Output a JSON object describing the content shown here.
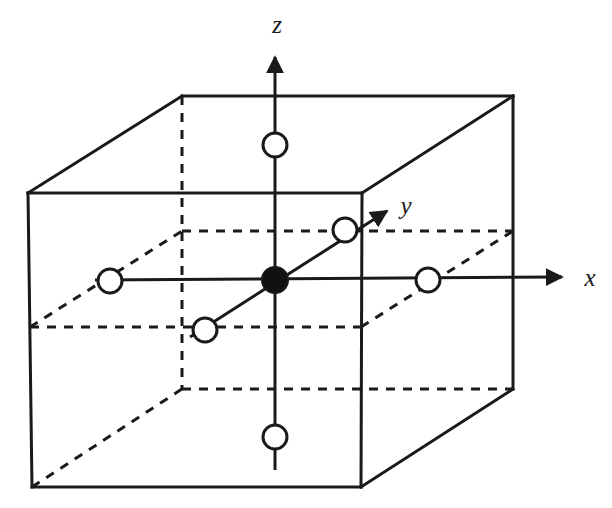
{
  "figure": {
    "background_color": "#ffffff",
    "line_color": "#1a1a1a",
    "atom_fill_open": "#ffffff",
    "atom_fill_filled": "#111111"
  },
  "axes": {
    "items": [
      {
        "id": "z",
        "label": "z",
        "label_x": 277,
        "label_y": 33,
        "from_x": 275,
        "from_y": 470,
        "to_x": 275,
        "to_y": 50
      },
      {
        "id": "x",
        "label": "x",
        "label_x": 590,
        "label_y": 286,
        "from_x": 95,
        "from_y": 280,
        "to_x": 568,
        "to_y": 277
      },
      {
        "id": "y",
        "label": "y",
        "label_x": 406,
        "label_y": 214,
        "from_x": 190,
        "from_y": 337,
        "to_x": 392,
        "to_y": 207
      }
    ]
  },
  "cube": {
    "front_face": {
      "top_left_x": 28,
      "top_left_y": 193,
      "top_right_x": 362,
      "top_right_y": 193,
      "bottom_right_x": 361,
      "bottom_right_y": 487,
      "bottom_left_x": 32,
      "bottom_left_y": 487
    },
    "back_face": {
      "top_left_x": 182,
      "top_left_y": 96,
      "top_right_x": 513,
      "top_right_y": 96,
      "bottom_right_x": 513,
      "bottom_right_y": 389,
      "bottom_left_x": 182,
      "bottom_left_y": 389
    },
    "mid_plane": {
      "front_left_x": 30,
      "front_left_y": 327,
      "front_right_x": 361,
      "front_right_y": 327,
      "back_left_x": 182,
      "back_left_y": 231,
      "back_right_x": 513,
      "back_right_y": 231
    },
    "solid_edges": [
      "front-top",
      "front-left",
      "front-right",
      "front-bottom",
      "back-top",
      "back-right-vertical",
      "top-left-diagonal",
      "top-right-diagonal",
      "bottom-right-diagonal"
    ],
    "dashed_edges": [
      "back-left-vertical",
      "back-bottom",
      "bottom-left-diagonal",
      "mid-plane-outline"
    ]
  },
  "atoms": {
    "center": {
      "name": "center-atom",
      "type": "filled",
      "cx": 275,
      "cy": 280,
      "r": 13,
      "position_label": "body center"
    },
    "neighbors": [
      {
        "name": "atom-z-top",
        "type": "open",
        "cx": 275,
        "cy": 145,
        "r": 12,
        "position_label": "+z"
      },
      {
        "name": "atom-z-bottom",
        "type": "open",
        "cx": 275,
        "cy": 437,
        "r": 12,
        "position_label": "-z"
      },
      {
        "name": "atom-x-left",
        "type": "open",
        "cx": 110,
        "cy": 281,
        "r": 12,
        "position_label": "-x"
      },
      {
        "name": "atom-x-right",
        "type": "open",
        "cx": 428,
        "cy": 280,
        "r": 12,
        "position_label": "+x"
      },
      {
        "name": "atom-y-far",
        "type": "open",
        "cx": 345,
        "cy": 230,
        "r": 12,
        "position_label": "+y"
      },
      {
        "name": "atom-y-near",
        "type": "open",
        "cx": 205,
        "cy": 330,
        "r": 12,
        "position_label": "-y"
      }
    ]
  }
}
